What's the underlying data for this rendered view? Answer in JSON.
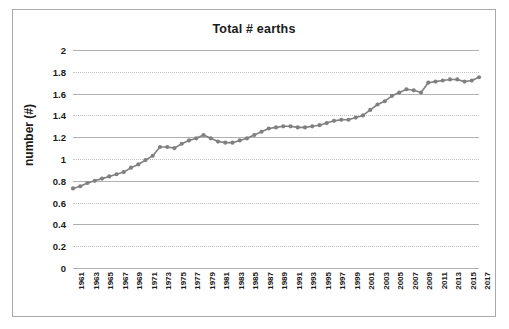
{
  "chart_data": {
    "type": "line",
    "title": "Total # earths",
    "xlabel": "",
    "ylabel": "number (#)",
    "ylim": [
      0,
      2
    ],
    "ytick_values": [
      0,
      0.2,
      0.4,
      0.6,
      0.8,
      1,
      1.2,
      1.4,
      1.6,
      1.8,
      2
    ],
    "ytick_labels": [
      "0",
      "0.2",
      "0.4",
      "0.6",
      "0.8",
      "1",
      "1.2",
      "1.4",
      "1.6",
      "1.8",
      "2"
    ],
    "grid": true,
    "legend": "none",
    "marker": "circle",
    "series_color": "#808080",
    "x": [
      1961,
      1962,
      1963,
      1964,
      1965,
      1966,
      1967,
      1968,
      1969,
      1970,
      1971,
      1972,
      1973,
      1974,
      1975,
      1976,
      1977,
      1978,
      1979,
      1980,
      1981,
      1982,
      1983,
      1984,
      1985,
      1986,
      1987,
      1988,
      1989,
      1990,
      1991,
      1992,
      1993,
      1994,
      1995,
      1996,
      1997,
      1998,
      1999,
      2000,
      2001,
      2002,
      2003,
      2004,
      2005,
      2006,
      2007,
      2008,
      2009,
      2010,
      2011,
      2012,
      2013,
      2014,
      2015,
      2016,
      2017
    ],
    "xtick_labels": [
      "1961",
      "1963",
      "1965",
      "1967",
      "1969",
      "1971",
      "1973",
      "1975",
      "1977",
      "1979",
      "1981",
      "1983",
      "1985",
      "1987",
      "1989",
      "1991",
      "1993",
      "1995",
      "1997",
      "1999",
      "2001",
      "2003",
      "2005",
      "2007",
      "2009",
      "2011",
      "2013",
      "2015",
      "2017"
    ],
    "series": [
      {
        "name": "Total # earths",
        "values": [
          0.73,
          0.75,
          0.78,
          0.8,
          0.82,
          0.84,
          0.86,
          0.88,
          0.92,
          0.95,
          0.99,
          1.03,
          1.11,
          1.11,
          1.1,
          1.14,
          1.17,
          1.19,
          1.22,
          1.19,
          1.16,
          1.15,
          1.15,
          1.17,
          1.19,
          1.22,
          1.25,
          1.28,
          1.29,
          1.3,
          1.3,
          1.29,
          1.29,
          1.3,
          1.31,
          1.33,
          1.35,
          1.36,
          1.36,
          1.38,
          1.4,
          1.45,
          1.5,
          1.53,
          1.58,
          1.61,
          1.64,
          1.63,
          1.61,
          1.7,
          1.71,
          1.72,
          1.73,
          1.73,
          1.71,
          1.72,
          1.75
        ]
      }
    ]
  }
}
